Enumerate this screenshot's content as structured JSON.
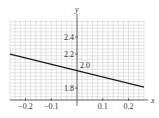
{
  "chart_data": {
    "type": "line",
    "title": "",
    "xlabel": "x",
    "ylabel": "y",
    "xlim": [
      -0.26,
      0.26
    ],
    "ylim": [
      1.66,
      2.6
    ],
    "grid": true,
    "x_ticks": [
      -0.2,
      -0.1,
      0.1,
      0.2
    ],
    "x_tick_labels": [
      "−0.2",
      "−0.1",
      "0.1",
      "0.2"
    ],
    "y_ticks": [
      1.8,
      2.2,
      2.4
    ],
    "y_tick_labels": [
      "1.8",
      "2.2",
      "2.4"
    ],
    "annotations": [
      {
        "text": "2.0",
        "x": 0,
        "y": 2.0
      }
    ],
    "series": [
      {
        "name": "line",
        "x": [
          -0.26,
          0.26
        ],
        "y": [
          2.2,
          1.81
        ]
      }
    ],
    "colors": {
      "line": "#1a1a1a",
      "grid": "#c8c8c8",
      "axis": "#444444"
    }
  }
}
